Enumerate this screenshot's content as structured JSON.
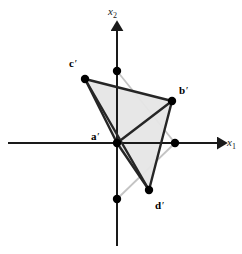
{
  "figure": {
    "type": "vector-diagram",
    "background_color": "#ffffff",
    "axes": {
      "horizontal": {
        "name": "x1",
        "label_main": "x",
        "label_sub": "1",
        "label_x": 227,
        "label_y": 137,
        "color": "#1a1a1a",
        "line_start_x": 8,
        "line_end_x": 219,
        "line_y": 143,
        "arrow": "right",
        "stroke_width": 2
      },
      "vertical": {
        "name": "x2",
        "label_main": "x",
        "label_sub": "2",
        "label_x": 108,
        "label_y": 6,
        "color": "#1a1a1a",
        "line_top_y": 29,
        "line_bottom_y": 246,
        "line_x": 117,
        "arrow": "up",
        "stroke_width": 2
      },
      "origin": {
        "x": 117,
        "y": 143
      }
    },
    "transformed_shape": {
      "color": "#262626",
      "stroke_width": 2.4,
      "fill_color": "#e6e6e6",
      "fill_opacity": 0.95,
      "vertices": [
        {
          "id": "a-prime",
          "label_text": "a",
          "prime": "′",
          "x": 117,
          "y": 143,
          "label_x": 91,
          "label_y": 131,
          "on_axis": true
        },
        {
          "id": "b-prime",
          "label_text": "b",
          "prime": "′",
          "x": 172,
          "y": 101,
          "label_x": 179,
          "label_y": 85,
          "on_axis": false
        },
        {
          "id": "c-prime",
          "label_text": "c",
          "prime": "′",
          "x": 85,
          "y": 79,
          "label_x": 69,
          "label_y": 58,
          "on_axis": false
        },
        {
          "id": "d-prime",
          "label_text": "d",
          "prime": "′",
          "x": 149,
          "y": 190,
          "label_x": 155,
          "label_y": 200,
          "on_axis": false
        }
      ],
      "edges": [
        [
          "a-prime",
          "b-prime"
        ],
        [
          "a-prime",
          "c-prime"
        ],
        [
          "a-prime",
          "d-prime"
        ],
        [
          "b-prime",
          "c-prime"
        ],
        [
          "b-prime",
          "d-prime"
        ],
        [
          "c-prime",
          "d-prime"
        ]
      ],
      "faces": [
        [
          "a-prime",
          "b-prime",
          "c-prime"
        ],
        [
          "a-prime",
          "b-prime",
          "d-prime"
        ],
        [
          "a-prime",
          "c-prime",
          "d-prime"
        ]
      ]
    },
    "original_shape": {
      "color": "#c4c4c4",
      "stroke_width": 1.8,
      "vertices": [
        {
          "id": "a",
          "x": 117,
          "y": 143,
          "on_axis": true
        },
        {
          "id": "b",
          "x": 175,
          "y": 143,
          "on_axis": true
        },
        {
          "id": "c",
          "x": 117,
          "y": 71,
          "on_axis": true
        },
        {
          "id": "d",
          "x": 117,
          "y": 199,
          "on_axis": true
        }
      ],
      "edges": [
        [
          "a",
          "b"
        ],
        [
          "a",
          "c"
        ],
        [
          "a",
          "d"
        ],
        [
          "b",
          "c"
        ],
        [
          "b",
          "d"
        ],
        [
          "c",
          "d"
        ]
      ]
    },
    "dots": [
      {
        "name": "vertex-dot-a-prime",
        "x": 117,
        "y": 143,
        "r": 4.2,
        "color": "#000000"
      },
      {
        "name": "vertex-dot-b-prime",
        "x": 172,
        "y": 101,
        "r": 4.2,
        "color": "#000000"
      },
      {
        "name": "vertex-dot-c-prime",
        "x": 85,
        "y": 79,
        "r": 4.2,
        "color": "#000000"
      },
      {
        "name": "vertex-dot-d-prime",
        "x": 149,
        "y": 190,
        "r": 4.2,
        "color": "#000000"
      },
      {
        "name": "axis-dot-x1-positive",
        "x": 175,
        "y": 143,
        "r": 4.2,
        "color": "#000000"
      },
      {
        "name": "axis-dot-x2-positive",
        "x": 117,
        "y": 71,
        "r": 4.2,
        "color": "#000000"
      },
      {
        "name": "axis-dot-x2-negative",
        "x": 117,
        "y": 199,
        "r": 4.2,
        "color": "#000000"
      }
    ]
  }
}
